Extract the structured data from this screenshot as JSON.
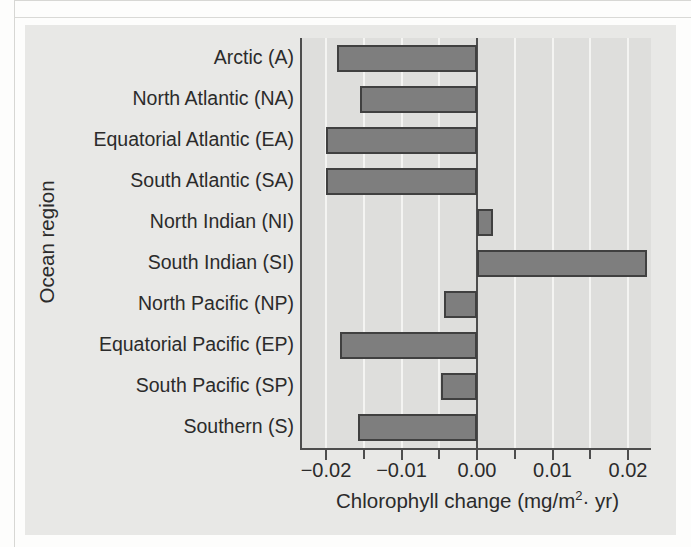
{
  "figure": {
    "background_color": "#e8e8e6",
    "plot_background_color": "#dededc",
    "bar_fill_color": "#7e7e7e",
    "bar_stroke_color": "#404040",
    "axis_color": "#4d4d4d",
    "gridline_color": "#f4f4f2"
  },
  "chart_data": {
    "type": "bar",
    "orientation": "horizontal",
    "title": "",
    "xlabel": "Chlorophyll change (mg/m2· yr)",
    "xlabel_parts": {
      "before": "Chlorophyll change (mg/m",
      "superscript": "2",
      "after": "· yr)"
    },
    "ylabel": "Ocean region",
    "categories": [
      "Arctic (A)",
      "North Atlantic (NA)",
      "Equatorial Atlantic (EA)",
      "South Atlantic (SA)",
      "North Indian (NI)",
      "South Indian (SI)",
      "North Pacific (NP)",
      "Equatorial Pacific (EP)",
      "South Pacific (SP)",
      "Southern (S)"
    ],
    "values": [
      -0.0186,
      -0.0155,
      -0.02,
      -0.02,
      0.0021,
      0.0225,
      -0.0044,
      -0.0181,
      -0.0048,
      -0.0157
    ],
    "xlim": [
      -0.0235,
      0.023
    ],
    "xticks": [
      -0.02,
      -0.01,
      0.0,
      0.01,
      0.02
    ],
    "xtick_labels": [
      "−0.02",
      "−0.01",
      "0.00",
      "0.01",
      "0.02"
    ],
    "minor_xticks": [
      -0.015,
      -0.005,
      0.005,
      0.015
    ],
    "grid": "vertical-minor-and-major",
    "legend": "none"
  }
}
